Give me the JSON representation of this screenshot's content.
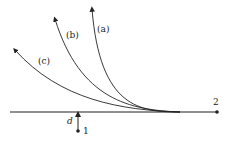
{
  "diagram": {
    "curves": [
      {
        "id": "a",
        "label": "(a)"
      },
      {
        "id": "b",
        "label": "(b)"
      },
      {
        "id": "c",
        "label": "(c)"
      }
    ],
    "points": {
      "one": "1",
      "two": "2"
    },
    "distance_label": "d",
    "colors": {
      "stroke": "#222222"
    }
  }
}
